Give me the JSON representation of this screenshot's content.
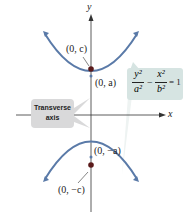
{
  "diagram": {
    "axes": {
      "x_label": "x",
      "y_label": "y"
    },
    "points": {
      "focus_top": "(0, c)",
      "vertex_top": "(0, a)",
      "vertex_bottom": "(0, −a)",
      "focus_bottom": "(0, −c)"
    },
    "equation": {
      "term1_num": "y²",
      "term1_den": "a²",
      "minus": "−",
      "term2_num": "x²",
      "term2_den": "b²",
      "equals": "= 1"
    },
    "callout": {
      "line1": "Transverse",
      "line2": "axis"
    },
    "colors": {
      "curve": "#5a7aa8",
      "focus": "#5a1a1a",
      "equation_box": "#d6e4e2",
      "callout_box": "#d9d9da",
      "axis": "#333333"
    }
  }
}
